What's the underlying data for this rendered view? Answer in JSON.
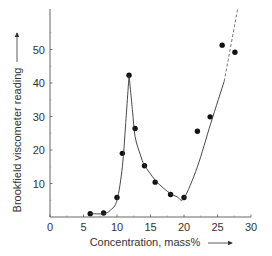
{
  "chart_data": {
    "type": "scatter",
    "title": "",
    "xlabel": "Concentration, mass%",
    "ylabel": "Brookfield viscometer reading",
    "xlim": [
      0,
      30
    ],
    "ylim": [
      0,
      60
    ],
    "x_ticks": [
      0,
      5,
      10,
      15,
      20,
      25,
      30
    ],
    "y_ticks": [
      10,
      20,
      30,
      40,
      50
    ],
    "grid": false,
    "legend": null,
    "series": [
      {
        "name": "measured",
        "style": "points",
        "x": [
          6,
          8,
          10,
          10.8,
          11.8,
          12.7,
          14.1,
          15.7,
          18,
          20,
          22,
          23.9,
          25.7,
          27.6
        ],
        "y": [
          1.0,
          1.2,
          5.8,
          19.0,
          42.3,
          26.4,
          15.3,
          10.4,
          6.7,
          5.8,
          25.6,
          29.9,
          51.3,
          49.2
        ]
      },
      {
        "name": "fitted curve",
        "style": "line",
        "x": [
          6,
          8,
          9,
          10,
          10.8,
          11.3,
          11.8,
          12.3,
          12.7,
          13.5,
          14.1,
          15.7,
          17,
          18,
          19,
          20,
          22,
          24,
          26
        ],
        "y": [
          1.0,
          1.0,
          2.0,
          5.0,
          15.0,
          28.0,
          42.3,
          32.0,
          24.0,
          18.5,
          15.5,
          11.0,
          8.5,
          7.0,
          6.0,
          5.6,
          15.0,
          28.0,
          40.5
        ]
      },
      {
        "name": "extrapolation",
        "style": "dashed",
        "x": [
          26,
          28
        ],
        "y": [
          40.5,
          62.0
        ]
      }
    ]
  },
  "axes": {
    "xlabel": "Concentration, mass% →",
    "ylabel": "Brookfield viscometer reading →",
    "x_tick_labels": [
      "0",
      "5",
      "10",
      "15",
      "20",
      "25",
      "30"
    ],
    "y_tick_labels": [
      "10",
      "20",
      "30",
      "40",
      "50"
    ]
  }
}
